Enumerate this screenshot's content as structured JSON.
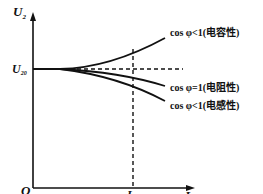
{
  "diagram": {
    "type": "external-characteristic",
    "axes": {
      "y_label_main": "U",
      "y_label_sub": "2",
      "x_label_main": "I",
      "x_label_sub": "2",
      "origin_label": "O"
    },
    "marks": {
      "u20_main": "U",
      "u20_sub": "20",
      "i2n_main": "I",
      "i2n_sub": "2N"
    },
    "curves": [
      {
        "id": "capacitive",
        "label": "cos φ<1(电容性)",
        "trend": "rising"
      },
      {
        "id": "resistive",
        "label": "cos φ=1(电阻性)",
        "trend": "slightly falling"
      },
      {
        "id": "inductive",
        "label": "cos φ<1(电感性)",
        "trend": "falling"
      }
    ],
    "colors": {
      "stroke": "#111111",
      "background": "#ffffff"
    }
  }
}
